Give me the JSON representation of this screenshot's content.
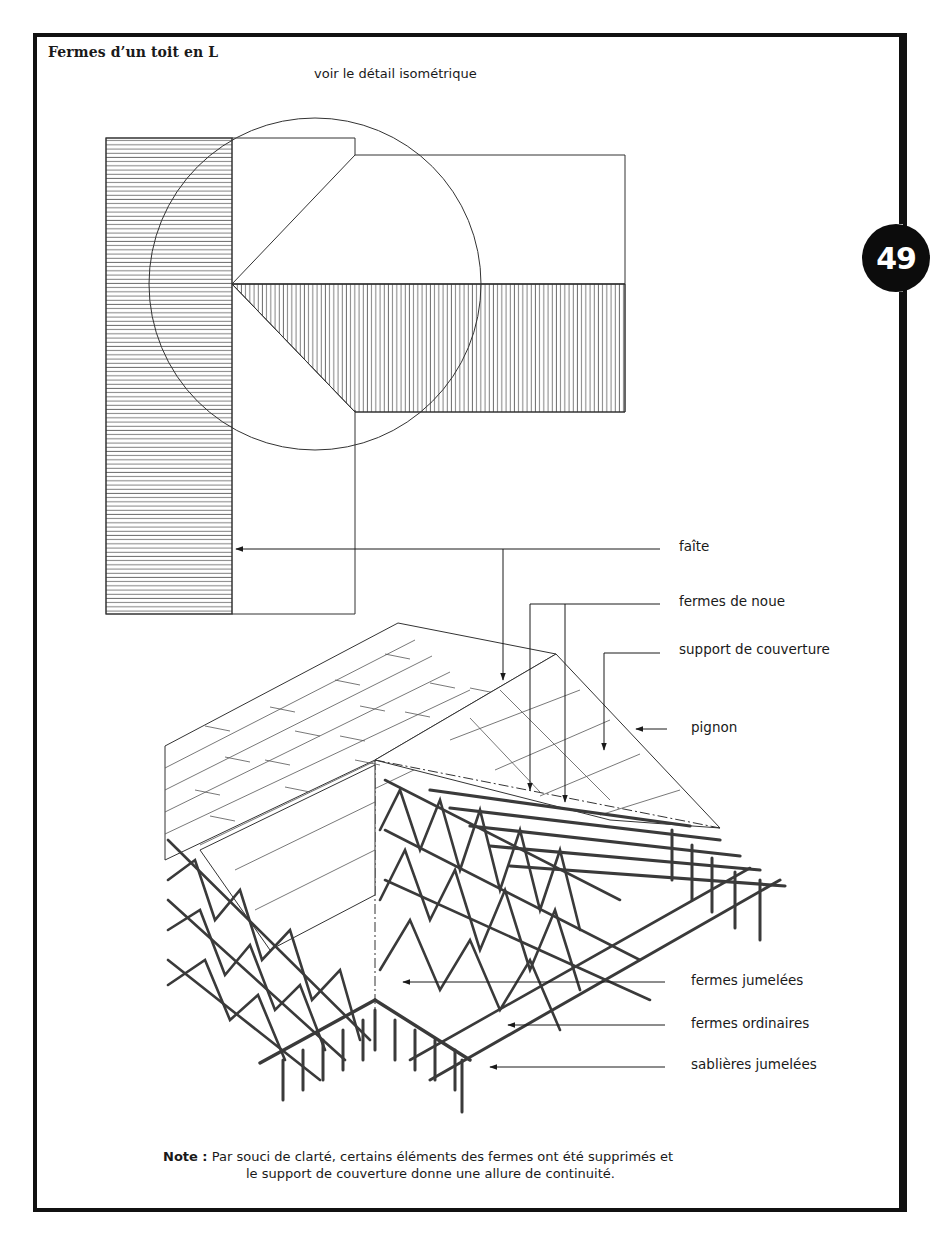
{
  "page": {
    "title": "Fermes d’un toit en L",
    "subtitle": "voir le détail isométrique",
    "page_number": "49"
  },
  "callouts": [
    {
      "id": "faite",
      "label": "faîte"
    },
    {
      "id": "fermes-de-noue",
      "label": "fermes de noue"
    },
    {
      "id": "support-de-couverture",
      "label": "support de couverture"
    },
    {
      "id": "pignon",
      "label": "pignon"
    },
    {
      "id": "fermes-jumelees",
      "label": "fermes jumelées"
    },
    {
      "id": "fermes-ordinaires",
      "label": "fermes ordinaires"
    },
    {
      "id": "sablieres-jumelees",
      "label": "sablières jumelées"
    }
  ],
  "note": {
    "prefix": "Note :",
    "line1": "Par souci de clarté, certains éléments des fermes ont été supprimés et",
    "line2": "le support de couverture donne une allure de continuité."
  },
  "colors": {
    "ink": "#1a1a1a",
    "frame": "#111111",
    "badge_bg": "#0c0c0c",
    "badge_fg": "#ffffff"
  }
}
